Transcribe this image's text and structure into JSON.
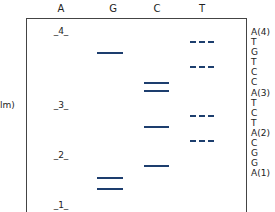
{
  "lanes": [
    "A",
    "G",
    "C",
    "T"
  ],
  "markers": [
    "4",
    "3",
    "2",
    "1"
  ],
  "y_label": "lm)",
  "sequence": [
    "A(4)",
    "T",
    "G",
    "T",
    "C",
    "C",
    "A(3)",
    "T",
    "C",
    "T",
    "A(2)",
    "C",
    "G",
    "G",
    "A(1)"
  ],
  "bands": {
    "A": [
      {
        "marker": "4",
        "y": 33
      },
      {
        "marker": "3",
        "y": 107
      },
      {
        "marker": "2",
        "y": 157
      },
      {
        "marker": "1",
        "y": 207
      }
    ],
    "G": [
      {
        "y": 52
      },
      {
        "y": 177
      },
      {
        "y": 189
      }
    ],
    "C": [
      {
        "y": 82
      },
      {
        "y": 91
      },
      {
        "y": 127
      },
      {
        "y": 165
      }
    ],
    "T": [
      {
        "y": 42
      },
      {
        "y": 67
      },
      {
        "y": 116
      },
      {
        "y": 141
      }
    ]
  },
  "colors": {
    "band": "#1d3e6e",
    "frame": "#444444"
  }
}
